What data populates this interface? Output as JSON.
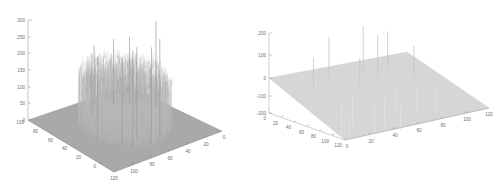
{
  "figure": {
    "background_color": "#ffffff",
    "panel_count": 2
  },
  "chart_data": [
    {
      "type": "surface",
      "panel": "left",
      "title": "",
      "xlabel": "",
      "ylabel": "",
      "zlabel": "",
      "grid": false,
      "legend": null,
      "description": "3D stem/surface plot showing a dense cylindrical disc of vertical lines on a flat base plane, with isolated tall spikes rising well above the disc",
      "zlim": [
        0,
        300
      ],
      "z_ticks": [
        0,
        50,
        100,
        150,
        200,
        250,
        300
      ],
      "xlim": [
        0,
        120
      ],
      "x_ticks": [
        120,
        100,
        80,
        60,
        40,
        20,
        0
      ],
      "ylim": [
        0,
        100
      ],
      "y_ticks": [
        100,
        80,
        60,
        40,
        20,
        0
      ],
      "plateau_level": 130,
      "base_level": 0,
      "colors": {
        "base_plane": "#a8a8a8",
        "stems": "#b9b9b9",
        "spikes": "#9a9a9a",
        "axis": "#8d8d8d",
        "tick_label": "#6e6e6e"
      },
      "spikes": [
        {
          "x": 18,
          "y": 58,
          "z": 258
        },
        {
          "x": 50,
          "y": 20,
          "z": 296
        },
        {
          "x": 62,
          "y": 17,
          "z": 288
        },
        {
          "x": 66,
          "y": 30,
          "z": 272
        },
        {
          "x": 78,
          "y": 22,
          "z": 286
        },
        {
          "x": 86,
          "y": 26,
          "z": 268
        },
        {
          "x": 96,
          "y": 44,
          "z": 252
        },
        {
          "x": 34,
          "y": 72,
          "z": 205
        },
        {
          "x": 44,
          "y": 80,
          "z": 196
        },
        {
          "x": 72,
          "y": 76,
          "z": 188
        },
        {
          "x": 58,
          "y": 88,
          "z": 178
        }
      ]
    },
    {
      "type": "surface",
      "panel": "right",
      "title": "",
      "xlabel": "",
      "ylabel": "",
      "zlabel": "",
      "grid": false,
      "legend": null,
      "description": "3D stem/surface plot showing a flat plane at zero with sparse positive and negative spikes scattered across it",
      "zlim": [
        -200,
        200
      ],
      "z_ticks": [
        200,
        100,
        0,
        -100,
        -200
      ],
      "xlim": [
        0,
        120
      ],
      "x_ticks": [
        0,
        20,
        40,
        60,
        80,
        100,
        120
      ],
      "ylim": [
        0,
        120
      ],
      "y_ticks": [
        0,
        20,
        40,
        60,
        80,
        100,
        120
      ],
      "plane_level": 0,
      "colors": {
        "base_plane": "#d4d4d4",
        "stems_positive": "#c2c2c2",
        "stems_negative": "#dcdcdc",
        "axis": "#9a9a9a",
        "tick_label": "#6e6e6e"
      },
      "spikes": [
        {
          "x": 20,
          "y": 34,
          "z": 150
        },
        {
          "x": 30,
          "y": 60,
          "z": -150
        },
        {
          "x": 40,
          "y": 22,
          "z": 195
        },
        {
          "x": 44,
          "y": 52,
          "z": -130
        },
        {
          "x": 52,
          "y": 72,
          "z": -160
        },
        {
          "x": 58,
          "y": 38,
          "z": 120
        },
        {
          "x": 64,
          "y": 66,
          "z": -145
        },
        {
          "x": 72,
          "y": 18,
          "z": 205
        },
        {
          "x": 78,
          "y": 30,
          "z": 185
        },
        {
          "x": 84,
          "y": 48,
          "z": -120
        },
        {
          "x": 90,
          "y": 24,
          "z": 175
        },
        {
          "x": 96,
          "y": 58,
          "z": -110
        },
        {
          "x": 104,
          "y": 40,
          "z": 135
        },
        {
          "x": 110,
          "y": 64,
          "z": -100
        },
        {
          "x": 26,
          "y": 80,
          "z": -115
        },
        {
          "x": 68,
          "y": 84,
          "z": -105
        }
      ]
    }
  ]
}
